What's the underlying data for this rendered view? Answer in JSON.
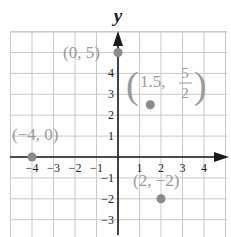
{
  "chart_data": {
    "type": "scatter",
    "title": "",
    "xlabel": "",
    "ylabel": "y",
    "xlim": [
      -5,
      5
    ],
    "ylim": [
      -4,
      5.8
    ],
    "grid": true,
    "x_ticks": [
      -4,
      -3,
      -2,
      -1,
      1,
      2,
      3,
      4
    ],
    "x_tick_labels": [
      "−4",
      "−3",
      "−2",
      "−1",
      "1",
      "2",
      "3",
      "4"
    ],
    "y_ticks": [
      4,
      3,
      2,
      1,
      -1,
      -2,
      -3
    ],
    "y_tick_labels": [
      "4",
      "3",
      "2",
      "1",
      "−1",
      "−2",
      "−3"
    ],
    "points": [
      {
        "x": 0,
        "y": 5,
        "label": "(0, 5)"
      },
      {
        "x": 1.5,
        "y": 2.5,
        "label": "(1.5, 5/2)"
      },
      {
        "x": -4,
        "y": 0,
        "label": "(−4, 0)"
      },
      {
        "x": 2,
        "y": -2,
        "label": "(2, −2)"
      }
    ]
  },
  "labels": {
    "y_axis": "y",
    "p1": "(0, 5)",
    "p2_open": "(",
    "p2_text": "1.5,",
    "p2_num": "5",
    "p2_den": "2",
    "p2_close": ")",
    "p3": "(−4, 0)",
    "p4": "(2, −2)"
  },
  "colors": {
    "grid": "#c8c8c8",
    "axis": "#1a1a1a",
    "point": "#8a8a8a",
    "point_label": "#9a9a9a",
    "tick_label": "#222222"
  }
}
